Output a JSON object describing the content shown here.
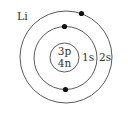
{
  "diagram": {
    "element_symbol": "Li",
    "nucleus": {
      "protons": "3p",
      "neutrons": "4n"
    },
    "shells": [
      {
        "label": "1s",
        "electrons": 2
      },
      {
        "label": "2s",
        "electrons": 1
      }
    ],
    "colors": {
      "line": "#5a5a5a",
      "electron": "#111111",
      "text": "#333333",
      "background": "#ffffff"
    }
  }
}
